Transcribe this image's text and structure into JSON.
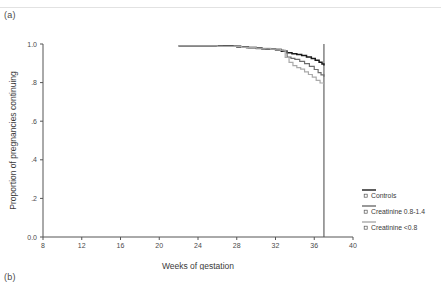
{
  "figure": {
    "panel_a_label": "(a)",
    "panel_b_label": "(b)"
  },
  "chart_data": {
    "type": "line",
    "title": "",
    "xlabel": "Weeks of gestation",
    "ylabel": "Proportion of pregnancies continuing",
    "xlim": [
      8,
      40
    ],
    "ylim": [
      0.0,
      1.0
    ],
    "xticks": [
      8,
      12,
      16,
      20,
      24,
      28,
      32,
      36,
      40
    ],
    "xtick_labels": [
      "8",
      "12",
      "16",
      "20",
      "24",
      "28",
      "32",
      "36",
      "40"
    ],
    "yticks": [
      0.0,
      0.2,
      0.4,
      0.6,
      0.8,
      1.0
    ],
    "ytick_labels": [
      "0.0",
      ".2",
      ".4",
      ".6",
      ".8",
      "1.0"
    ],
    "grid": false,
    "legend_position": "right",
    "annotations": [
      {
        "name": "term-reference-line",
        "type": "vline",
        "x": 37.0
      }
    ],
    "series": [
      {
        "name": "Controls",
        "color": "#1a1a1a",
        "width": 1.5,
        "step": "post",
        "x": [
          22.0,
          27.6,
          28.4,
          29.2,
          30.0,
          30.6,
          31.2,
          32.0,
          32.6,
          33.2,
          33.7,
          34.2,
          34.7,
          35.2,
          35.7,
          36.1,
          36.5,
          36.8,
          37.0
        ],
        "y": [
          0.99,
          0.988,
          0.985,
          0.982,
          0.979,
          0.976,
          0.974,
          0.971,
          0.962,
          0.955,
          0.95,
          0.945,
          0.94,
          0.933,
          0.925,
          0.916,
          0.906,
          0.896,
          0.888
        ]
      },
      {
        "name": "Creatinine 0.8-1.4",
        "color": "#6e6e6e",
        "width": 1.2,
        "step": "post",
        "x": [
          22.0,
          26.5,
          28.0,
          29.0,
          30.0,
          31.0,
          32.0,
          32.8,
          33.2,
          33.6,
          34.0,
          34.5,
          35.0,
          35.5,
          36.0,
          36.4,
          36.7,
          37.0
        ],
        "y": [
          0.99,
          0.988,
          0.983,
          0.98,
          0.976,
          0.972,
          0.968,
          0.963,
          0.932,
          0.926,
          0.92,
          0.91,
          0.898,
          0.884,
          0.868,
          0.852,
          0.84,
          0.83
        ]
      },
      {
        "name": "Creatinine <0.8",
        "color": "#aaaaaa",
        "width": 1.2,
        "step": "post",
        "x": [
          22.0,
          26.0,
          28.5,
          30.0,
          31.5,
          32.5,
          33.0,
          33.4,
          33.8,
          34.2,
          34.6,
          35.0,
          35.4,
          35.8,
          36.2,
          36.6,
          37.0
        ],
        "y": [
          0.99,
          0.987,
          0.983,
          0.978,
          0.973,
          0.968,
          0.93,
          0.905,
          0.888,
          0.878,
          0.87,
          0.856,
          0.842,
          0.828,
          0.812,
          0.798,
          0.79
        ]
      }
    ]
  },
  "legend": {
    "entries": [
      {
        "label": "Controls",
        "color": "#1a1a1a"
      },
      {
        "label": "Creatinine 0.8-1.4",
        "color": "#6e6e6e"
      },
      {
        "label": "Creatinine <0.8",
        "color": "#aaaaaa"
      }
    ]
  }
}
